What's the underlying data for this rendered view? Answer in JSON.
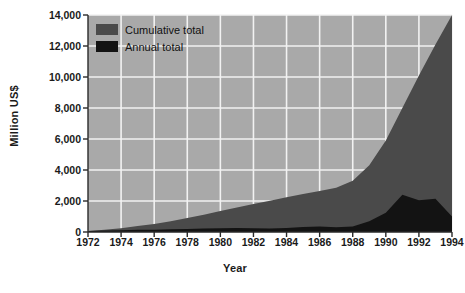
{
  "chart_data": {
    "type": "area",
    "title": "",
    "xlabel": "Year",
    "ylabel": "Million US$",
    "xlim": [
      1972,
      1994
    ],
    "ylim": [
      0,
      14000
    ],
    "grid": true,
    "legend_position": "top-left",
    "xticks": [
      "1972",
      "1974",
      "1976",
      "1978",
      "1980",
      "1982",
      "1984",
      "1986",
      "1988",
      "1990",
      "1992",
      "1994"
    ],
    "yticks": [
      "0",
      "2,000",
      "4,000",
      "6,000",
      "8,000",
      "10,000",
      "12,000",
      "14,000"
    ],
    "x": [
      1972,
      1973,
      1974,
      1975,
      1976,
      1977,
      1978,
      1979,
      1980,
      1981,
      1982,
      1983,
      1984,
      1985,
      1986,
      1987,
      1988,
      1989,
      1990,
      1991,
      1992,
      1993,
      1994
    ],
    "series": [
      {
        "name": "Cumulative total",
        "color": "#4a4a4a",
        "values": [
          60,
          140,
          250,
          380,
          520,
          700,
          900,
          1120,
          1350,
          1580,
          1800,
          2020,
          2250,
          2450,
          2650,
          2850,
          3300,
          4300,
          5900,
          8000,
          10100,
          12100,
          14000
        ]
      },
      {
        "name": "Annual total",
        "color": "#131313",
        "values": [
          60,
          90,
          120,
          140,
          150,
          180,
          200,
          220,
          240,
          260,
          250,
          230,
          260,
          330,
          360,
          300,
          360,
          700,
          1250,
          2400,
          2050,
          2150,
          1000
        ]
      }
    ]
  },
  "legend": {
    "items": [
      {
        "label": "Cumulative total",
        "color": "#4a4a4a"
      },
      {
        "label": "Annual total",
        "color": "#131313"
      }
    ]
  },
  "colors": {
    "plot_background": "#a9a9a9",
    "gridline": "#f2f2f2",
    "axis": "#2a2a2a",
    "page_background": "#ffffff"
  }
}
